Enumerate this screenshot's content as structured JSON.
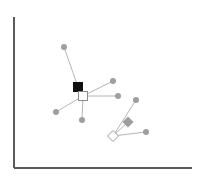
{
  "chart_data": {
    "type": "scatter",
    "title": "",
    "subtitle": "",
    "xlabel": "",
    "ylabel": "",
    "xlim": [
      14,
      192
    ],
    "ylim": [
      17,
      168
    ],
    "grid": false,
    "legend": null,
    "axis_ticks": {
      "x": [],
      "y": []
    },
    "axes": {
      "origin_x": 14,
      "origin_y": 168,
      "y_axis_top": 17,
      "x_axis_right": 192,
      "color": "#5a5a5a",
      "width": 2
    },
    "marker_styles": {
      "circle_gray": {
        "shape": "circle",
        "fill": "#9e9e9e",
        "stroke": "none",
        "size": 6
      },
      "square_black": {
        "shape": "square",
        "fill": "#111111",
        "stroke": "#111111",
        "size": 9
      },
      "square_white": {
        "shape": "square",
        "fill": "#ffffff",
        "stroke": "#8c8c8c",
        "size": 9
      },
      "diamond_gray": {
        "shape": "diamond",
        "fill": "#9e9e9e",
        "stroke": "none",
        "size": 11
      },
      "diamond_white": {
        "shape": "diamond",
        "fill": "#ffffff",
        "stroke": "#9e9e9e",
        "size": 11
      }
    },
    "edge_style": {
      "color": "#b5b5b5",
      "width": 1
    },
    "nodes": [
      {
        "id": "n1",
        "label": "top-circle",
        "x": 64,
        "y": 47,
        "style": "circle_gray"
      },
      {
        "id": "n2",
        "label": "black-square-hub",
        "x": 78,
        "y": 87,
        "style": "square_black"
      },
      {
        "id": "n3",
        "label": "white-square-hub",
        "x": 83,
        "y": 96,
        "style": "square_white"
      },
      {
        "id": "n4",
        "label": "upper-right-circle",
        "x": 113,
        "y": 81,
        "style": "circle_gray"
      },
      {
        "id": "n5",
        "label": "right-circle",
        "x": 118,
        "y": 96,
        "style": "circle_gray"
      },
      {
        "id": "n6",
        "label": "left-circle",
        "x": 56,
        "y": 112,
        "style": "circle_gray"
      },
      {
        "id": "n7",
        "label": "bottom-circle",
        "x": 82,
        "y": 120,
        "style": "circle_gray"
      },
      {
        "id": "n8",
        "label": "far-right-circle",
        "x": 136,
        "y": 100,
        "style": "circle_gray"
      },
      {
        "id": "n9",
        "label": "gray-diamond",
        "x": 128,
        "y": 122,
        "style": "diamond_gray"
      },
      {
        "id": "n10",
        "label": "white-diamond-hub",
        "x": 113,
        "y": 136,
        "style": "diamond_white"
      },
      {
        "id": "n11",
        "label": "lower-right-circle",
        "x": 146,
        "y": 132,
        "style": "circle_gray"
      }
    ],
    "edges": [
      {
        "from": "n1",
        "to": "n2"
      },
      {
        "from": "n2",
        "to": "n3"
      },
      {
        "from": "n3",
        "to": "n4"
      },
      {
        "from": "n3",
        "to": "n5"
      },
      {
        "from": "n3",
        "to": "n6"
      },
      {
        "from": "n3",
        "to": "n7"
      },
      {
        "from": "n10",
        "to": "n8"
      },
      {
        "from": "n10",
        "to": "n9"
      },
      {
        "from": "n10",
        "to": "n11"
      }
    ]
  }
}
